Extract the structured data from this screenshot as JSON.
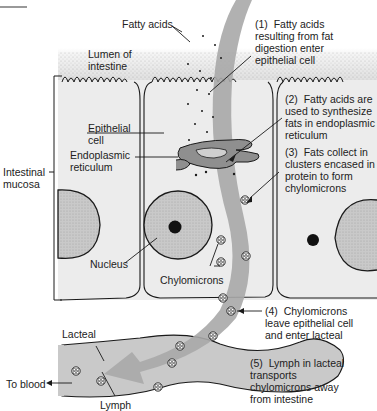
{
  "diagram": {
    "labels": {
      "fatty_acids": "Fatty acids",
      "lumen": "Lumen of\nintestine",
      "epithelial_cell": "Epithelial\ncell",
      "er": "Endoplasmic\nreticulum",
      "intestinal_mucosa": "Intestinal\nmucosa",
      "nucleus": "Nucleus",
      "chylomicrons": "Chylomicrons",
      "lacteal": "Lacteal",
      "to_blood": "To blood",
      "lymph": "Lymph"
    },
    "steps": [
      {
        "num": "(1)",
        "text": "(1)  Fatty acids\nresulting from fat\ndigestion enter\nepithelial cell"
      },
      {
        "num": "(2)",
        "text": "(2)  Fatty acids are\nused to synthesize\nfats in endoplasmic\nreticulum"
      },
      {
        "num": "(3)",
        "text": "(3)  Fats collect in\nclusters encased in\nprotein to form\nchylomicrons"
      },
      {
        "num": "(4)",
        "text": "(4)  Chylomicrons\nleave epithelial cell\nand enter lacteal"
      },
      {
        "num": "(5)",
        "text": "(5)  Lymph in lacteal\ntransports\nchylomicrons away\nfrom intestine"
      }
    ],
    "colors": {
      "cell_fill": "#ececec",
      "lumen_stipple": "#bdbdbd",
      "pathway_arrow": "#a9a9a9",
      "nucleus_fill": "#c4c4c4",
      "lacteal_fill": "#c9c9c9",
      "outline": "#1a1a1a"
    }
  }
}
